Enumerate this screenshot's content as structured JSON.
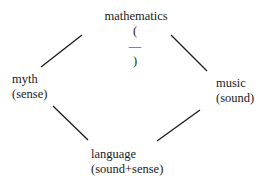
{
  "diagram": {
    "nodes": {
      "top": {
        "label": "mathematics",
        "sub_open": "(",
        "sub_mid": "—",
        "sub_close": ")"
      },
      "left": {
        "label": "myth",
        "sub": "(sense)"
      },
      "right": {
        "label": "music",
        "sub": "(sound)"
      },
      "bottom": {
        "label": "language",
        "sub": "(sound+sense)"
      }
    },
    "edges": [
      {
        "from": "myth",
        "to": "mathematics"
      },
      {
        "from": "mathematics",
        "to": "music"
      },
      {
        "from": "myth",
        "to": "language"
      },
      {
        "from": "language",
        "to": "music"
      }
    ],
    "line_color": "#1a1a1a"
  }
}
